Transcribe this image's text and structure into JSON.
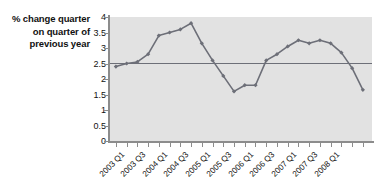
{
  "chart_data": {
    "type": "line",
    "title": "",
    "subtitle": "",
    "xlabel": "",
    "ylabel": "% change quarter on quarter of previous year",
    "ylabel_lines": [
      "% change quarter",
      "on quarter of",
      "previous year"
    ],
    "ylim": [
      0,
      4
    ],
    "ytick_labels": [
      "0",
      "0.5",
      "1",
      "1.5",
      "2",
      "2.5",
      "3",
      "3.5",
      "4"
    ],
    "ytick_values": [
      0,
      0.5,
      1,
      1.5,
      2,
      2.5,
      3,
      3.5,
      4
    ],
    "grid": false,
    "legend": "none",
    "background_color": "#e2e2e2",
    "line_color": "#6d6f78",
    "marker_color": "#6d6f78",
    "axis_color": "#8c8c8c",
    "x": [
      "2003 Q1",
      "2003 Q2",
      "2003 Q3",
      "2003 Q4",
      "2004 Q1",
      "2004 Q2",
      "2004 Q3",
      "2004 Q4",
      "2005 Q1",
      "2005 Q2",
      "2005 Q3",
      "2005 Q4",
      "2006 Q1",
      "2006 Q2",
      "2006 Q3",
      "2006 Q4",
      "2007 Q1",
      "2007 Q2",
      "2007 Q3",
      "2007 Q4",
      "2008 Q1",
      "2008 Q2",
      "2008 Q3"
    ],
    "xtick_labels": [
      "2003 Q1",
      "",
      "2003 Q3",
      "",
      "2004 Q1",
      "",
      "2004 Q3",
      "",
      "2005 Q1",
      "",
      "2005 Q3",
      "",
      "2006 Q1",
      "",
      "2006 Q3",
      "",
      "2007 Q1",
      "",
      "2007 Q3",
      "",
      "2008 Q1",
      "",
      ""
    ],
    "values": [
      2.4,
      2.5,
      2.55,
      2.8,
      3.4,
      3.5,
      3.6,
      3.8,
      3.15,
      2.6,
      2.1,
      1.6,
      1.8,
      1.8,
      2.6,
      2.8,
      3.05,
      3.25,
      3.15,
      3.25,
      3.15,
      2.85,
      2.35
    ],
    "series": [
      {
        "name": "% change quarter on quarter of previous year",
        "values": [
          2.4,
          2.5,
          2.55,
          2.8,
          3.4,
          3.5,
          3.6,
          3.8,
          3.15,
          2.6,
          2.1,
          1.6,
          1.8,
          1.8,
          2.6,
          2.8,
          3.05,
          3.25,
          3.15,
          3.25,
          3.15,
          2.85,
          2.35
        ]
      }
    ],
    "final_point_value": 1.65,
    "annotations": [
      {
        "type": "horizontal-reference-line",
        "value": 2.5,
        "label": ""
      }
    ]
  }
}
